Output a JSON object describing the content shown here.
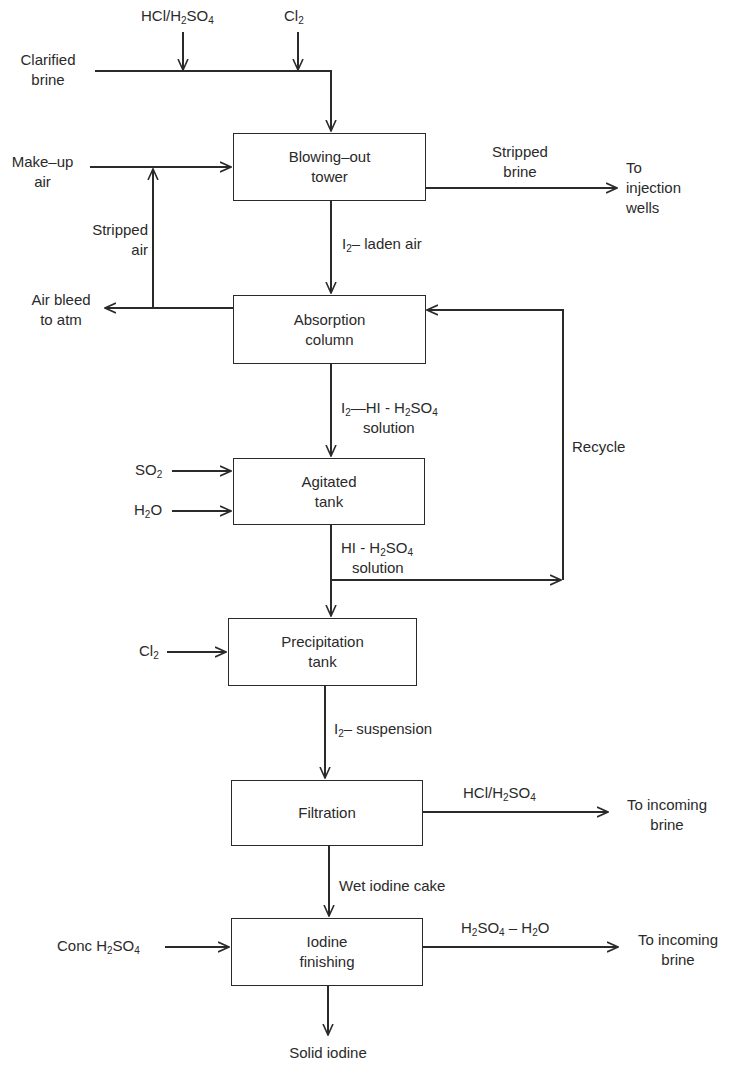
{
  "diagram": {
    "type": "process-flow",
    "units": {
      "blowing_out_tower": {
        "line1": "Blowing–out",
        "line2": "tower"
      },
      "absorption_column": {
        "line1": "Absorption",
        "line2": "column"
      },
      "agitated_tank": {
        "line1": "Agitated",
        "line2": "tank"
      },
      "precipitation_tank": {
        "line1": "Precipitation",
        "line2": "tank"
      },
      "filtration": {
        "line1": "Filtration"
      },
      "iodine_finishing": {
        "line1": "Iodine",
        "line2": "finishing"
      }
    },
    "streams": {
      "acid_feed": {
        "pre": "HCl/H",
        "sub1": "2",
        "mid": "SO",
        "sub2": "4"
      },
      "cl2_top": {
        "pre": "Cl",
        "sub1": "2"
      },
      "clarified_brine": {
        "line1": "Clarified",
        "line2": "brine"
      },
      "makeup_air": {
        "line1": "Make–up",
        "line2": "air"
      },
      "stripped_brine": {
        "line1": "Stripped",
        "line2": "brine"
      },
      "to_injection_wells": {
        "line1": "To",
        "line2": "injection",
        "line3": "wells"
      },
      "stripped_air": {
        "line1": "Stripped",
        "line2": "air"
      },
      "i2_laden_air": {
        "pre": "I",
        "sub1": "2",
        "post": "– laden  air"
      },
      "air_bleed": {
        "line1": "Air bleed",
        "line2": "to atm"
      },
      "i2_hi_h2so4": {
        "pre": "I",
        "sub1": "2",
        "mid": "—HI  -  H",
        "sub2": "2",
        "mid2": "SO",
        "sub3": "4",
        "line2": "solution"
      },
      "so2": {
        "pre": "SO",
        "sub1": "2"
      },
      "h2o": {
        "pre": "H",
        "sub1": "2",
        "post": "O"
      },
      "hi_h2so4": {
        "pre": "HI  -  H",
        "sub1": "2",
        "mid": "SO",
        "sub2": "4",
        "line2": "solution"
      },
      "recycle": {
        "label": "Recycle"
      },
      "cl2_precip": {
        "pre": "Cl",
        "sub1": "2"
      },
      "i2_suspension": {
        "pre": "I",
        "sub1": "2",
        "post": "– suspension"
      },
      "filtrate_acid": {
        "pre": "HCl/H",
        "sub1": "2",
        "mid": "SO",
        "sub2": "4"
      },
      "to_incoming_brine_1": {
        "line1": "To  incoming",
        "line2": "brine"
      },
      "wet_iodine_cake": {
        "label": "Wet  iodine  cake"
      },
      "conc_h2so4": {
        "pre": "Conc  H",
        "sub1": "2",
        "mid": "SO",
        "sub2": "4"
      },
      "h2so4_h2o": {
        "pre": "H",
        "sub1": "2",
        "mid": "SO",
        "sub2": "4",
        "mid2": " – H",
        "sub3": "2",
        "post": "O"
      },
      "to_incoming_brine_2": {
        "line1": "To  incoming",
        "line2": "brine"
      },
      "solid_iodine": {
        "label": "Solid  iodine"
      }
    },
    "colors": {
      "line": "#2a2a2a",
      "background": "#ffffff"
    }
  }
}
